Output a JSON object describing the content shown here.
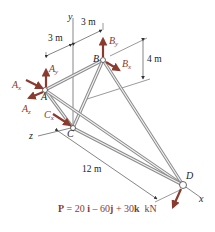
{
  "figure": {
    "type": "3D space truss free-body diagram",
    "joints": [
      {
        "id": "A",
        "label": "A"
      },
      {
        "id": "B",
        "label": "B"
      },
      {
        "id": "C",
        "label": "C"
      },
      {
        "id": "D",
        "label": "D"
      }
    ],
    "axes": {
      "x": "x",
      "y": "y",
      "z": "z"
    },
    "reactions": {
      "Ax": {
        "base": "A",
        "sub": "x"
      },
      "Ay": {
        "base": "A",
        "sub": "y"
      },
      "Az": {
        "base": "A",
        "sub": "z"
      },
      "Bx": {
        "base": "B",
        "sub": "x"
      },
      "By": {
        "base": "B",
        "sub": "y"
      },
      "Cx": {
        "base": "C",
        "sub": "x"
      }
    },
    "dimensions": {
      "d1": "3 m",
      "d2": "3 m",
      "height": "4 m",
      "length": "12 m"
    },
    "load": {
      "prefix": "P",
      "equals": "=",
      "i_coef": "20",
      "i_unit": "i",
      "j_sign": "–",
      "j_coef": "60",
      "j_unit": "j",
      "k_sign": "+",
      "k_coef": "30",
      "k_unit": "k",
      "units": "kN"
    },
    "colors": {
      "force_arrow": "#8a3a2e",
      "member": "#9a9a9a",
      "member_highlight": "#e8e8e8",
      "line": "#333333"
    }
  }
}
